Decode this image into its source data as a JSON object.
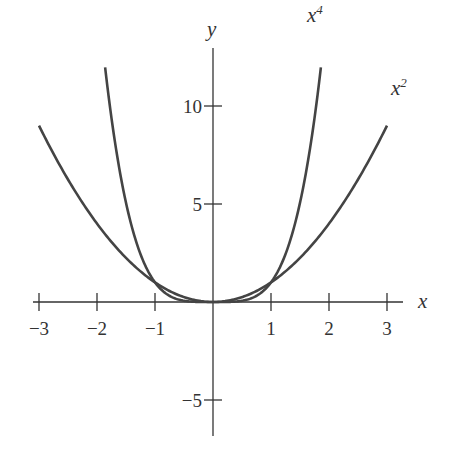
{
  "chart_data": {
    "type": "line",
    "title": "",
    "xlabel": "x",
    "ylabel": "y",
    "xlim": [
      -3.3,
      3.3
    ],
    "ylim": [
      -7,
      13
    ],
    "xticks": [
      -3,
      -2,
      -1,
      1,
      2,
      3
    ],
    "xtick_labels": [
      "−3",
      "−2",
      "−1",
      "1",
      "2",
      "3"
    ],
    "yticks": [
      -5,
      5,
      10
    ],
    "ytick_labels": [
      "−5",
      "5",
      "10"
    ],
    "grid": false,
    "legend": "none",
    "series": [
      {
        "name": "x^2",
        "label": "x",
        "sup": "2",
        "domain": [
          -3,
          3
        ],
        "x": [
          -3,
          -2,
          -1,
          0,
          1,
          2,
          3
        ],
        "values": [
          9,
          4,
          1,
          0,
          1,
          4,
          9
        ]
      },
      {
        "name": "x^4",
        "label": "x",
        "sup": "4",
        "domain": [
          -1.86,
          1.86
        ],
        "x": [
          -1.86,
          -1,
          0,
          1,
          1.86
        ],
        "values": [
          12,
          1,
          0,
          1,
          12
        ]
      }
    ],
    "annotations": [
      {
        "text": "x^4",
        "x": 1.9,
        "y": 14
      },
      {
        "text": "x^2",
        "x": 3.1,
        "y": 10.3
      }
    ]
  },
  "colors": {
    "curve": "#444444",
    "axis": "#333333"
  }
}
